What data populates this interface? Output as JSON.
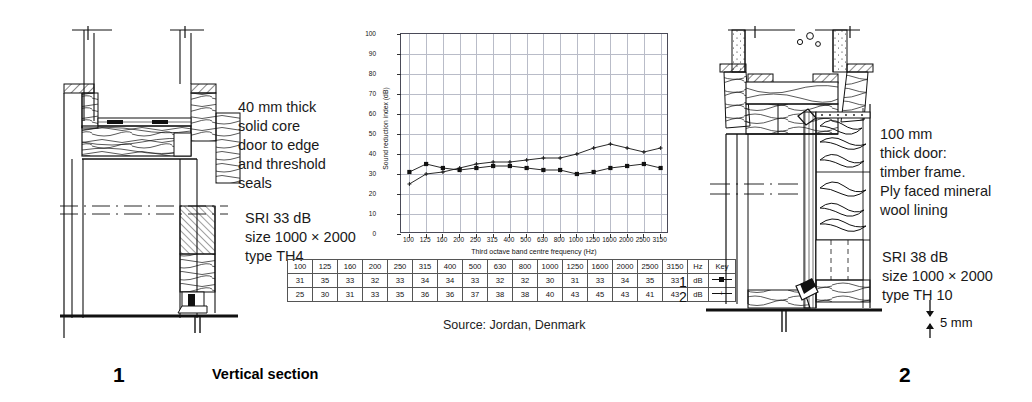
{
  "figure": {
    "source_note": "Source: Jordan, Denmark",
    "caption_left_number": "1",
    "caption_left_text": "Vertical section",
    "caption_right_number": "2"
  },
  "left_detail": {
    "number": "1",
    "description": "40 mm thick\nsolid core\ndoor to edge\nand threshold\nseals",
    "performance": "SRI 33 dB\nsize 1000 × 2000\ntype TH4"
  },
  "right_detail": {
    "number": "2",
    "description": "100 mm\nthick door:\ntimber frame.\nPly faced mineral\nwool lining",
    "performance": "SRI 38 dB\nsize 1000 × 2000\ntype TH 10",
    "dimension_label": "5 mm"
  },
  "chart_data": {
    "type": "line",
    "title": "",
    "xlabel": "Third octave band centre frequency (Hz)",
    "ylabel": "Sound reduction index (dB)",
    "categories": [
      "100",
      "125",
      "160",
      "200",
      "250",
      "315",
      "400",
      "500",
      "630",
      "800",
      "1000",
      "1250",
      "1600",
      "2000",
      "2500",
      "3150"
    ],
    "ylim": [
      0,
      100
    ],
    "yticks": [
      0,
      10,
      20,
      30,
      40,
      50,
      60,
      70,
      80,
      90,
      100
    ],
    "grid": true,
    "legend_position": "table-key",
    "series": [
      {
        "name": "1",
        "unit": "dB",
        "marker": "filled-square",
        "linestyle": "solid",
        "values": [
          31,
          35,
          33,
          32,
          33,
          34,
          34,
          33,
          32,
          32,
          30,
          31,
          33,
          34,
          35,
          33
        ]
      },
      {
        "name": "2",
        "unit": "dB",
        "marker": "small-cross",
        "linestyle": "solid",
        "values": [
          25,
          30,
          31,
          33,
          35,
          36,
          36,
          37,
          38,
          38,
          40,
          43,
          45,
          43,
          41,
          43
        ]
      }
    ]
  },
  "table": {
    "unit_header": "Hz",
    "key_header": "Key",
    "row_unit": "dB",
    "row_labels": [
      "1",
      "2"
    ]
  }
}
